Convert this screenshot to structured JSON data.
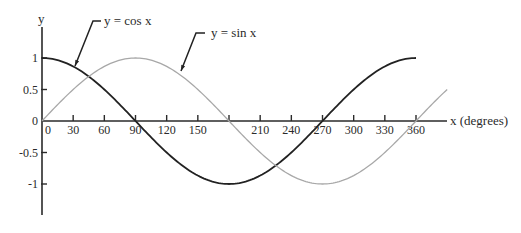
{
  "chart_data": {
    "type": "line",
    "title": "",
    "xlabel": "x (degrees)",
    "ylabel": "y",
    "xlim": [
      0,
      390
    ],
    "ylim": [
      -1.5,
      1.5
    ],
    "grid": false,
    "legend": "none (inline annotations)",
    "x_ticks": [
      0,
      30,
      60,
      90,
      120,
      150,
      180,
      210,
      240,
      270,
      300,
      330,
      360
    ],
    "x_tick_labels": [
      "0",
      "30",
      "60",
      "90",
      "120",
      "150",
      "",
      "210",
      "240",
      "270",
      "300",
      "330",
      "360"
    ],
    "y_ticks": [
      1,
      0.5,
      0,
      -0.5,
      -1
    ],
    "y_tick_labels": [
      "1",
      "0.5",
      "0",
      "-0.5",
      "-1"
    ],
    "series": [
      {
        "name": "y = cos x",
        "function": "cos",
        "color": "#222222",
        "x_range": [
          0,
          360
        ],
        "x": [
          0,
          30,
          60,
          90,
          120,
          150,
          180,
          210,
          240,
          270,
          300,
          330,
          360
        ],
        "values": [
          1,
          0.866,
          0.5,
          0,
          -0.5,
          -0.866,
          -1,
          -0.866,
          -0.5,
          0,
          0.5,
          0.866,
          1
        ]
      },
      {
        "name": "y = sin x",
        "function": "sin",
        "color": "#a8a8a8",
        "x_range": [
          0,
          390
        ],
        "x": [
          0,
          30,
          60,
          90,
          120,
          150,
          180,
          210,
          240,
          270,
          300,
          330,
          360,
          390
        ],
        "values": [
          0,
          0.5,
          0.866,
          1,
          0.866,
          0.5,
          0,
          -0.5,
          -0.866,
          -1,
          -0.866,
          -0.5,
          0,
          0.5
        ]
      }
    ],
    "annotations": [
      {
        "text": "y = cos x",
        "points_to_x": 31,
        "series": "y = cos x"
      },
      {
        "text": "y = sin x",
        "points_to_x": 131,
        "series": "y = sin x"
      }
    ]
  },
  "layout": {
    "origin_px": [
      42,
      121
    ],
    "px_per_degree": 1.0389,
    "px_per_unit_y": 63,
    "y_axis_top_px": 27,
    "y_axis_bottom_px": 215,
    "x_axis_end_px": 447,
    "annotation_positions": [
      {
        "tip": [
          75,
          66
        ],
        "knee": [
          93,
          21
        ],
        "end": [
          101,
          21
        ],
        "text_xy": [
          104,
          25
        ]
      },
      {
        "tip": [
          181,
          71
        ],
        "knee": [
          196,
          33
        ],
        "end": [
          205,
          33
        ],
        "text_xy": [
          211,
          37
        ]
      }
    ]
  }
}
